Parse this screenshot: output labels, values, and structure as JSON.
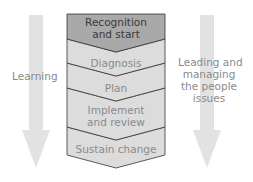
{
  "colors": {
    "arrow_fill": "#e2e2e2",
    "first_stage_fill": "#a9a9a9",
    "stage_fill": "#dcdcdc",
    "outline": "#333333",
    "side_text": "#8a8a8a",
    "first_stage_text": "#3a3a3a"
  },
  "left_arrow": {
    "label": "Learning"
  },
  "right_arrow": {
    "label_lines": [
      "Leading and",
      "managing",
      "the people",
      "issues"
    ]
  },
  "stages": [
    {
      "lines": [
        "Recognition",
        "and start"
      ]
    },
    {
      "lines": [
        "Diagnosis"
      ]
    },
    {
      "lines": [
        "Plan"
      ]
    },
    {
      "lines": [
        "Implement",
        "and review"
      ]
    },
    {
      "lines": [
        "Sustain change"
      ]
    }
  ]
}
